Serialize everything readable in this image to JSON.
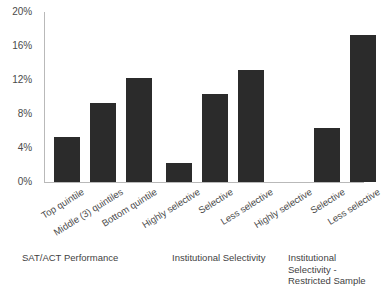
{
  "chart_data": {
    "type": "bar",
    "title": "",
    "subtitle": "",
    "xlabel": "",
    "ylabel": "",
    "ylim": [
      0,
      20
    ],
    "y_tick_labels": [
      "0%",
      "4%",
      "8%",
      "12%",
      "16%",
      "20%"
    ],
    "y_tick_values": [
      0,
      4,
      8,
      12,
      16,
      20
    ],
    "grid": false,
    "legend": "none",
    "bar_color": "#2b2b2b",
    "axis_color": "#b9b9b9",
    "value_suffix": "%",
    "categories": [
      "Top quintile",
      "Middle (3) quintiles",
      "Bottom quintile",
      "Highly selective",
      "Selective",
      "Less selective",
      "Highly selective",
      "Selective",
      "Less selective"
    ],
    "values": [
      5.3,
      9.3,
      12.2,
      2.2,
      10.4,
      13.2,
      0,
      6.3,
      17.3
    ],
    "groups": [
      {
        "caption": "SAT/ACT Performance",
        "categories": [
          "Top quintile",
          "Middle (3) quintiles",
          "Bottom quintile"
        ],
        "values": [
          5.3,
          9.3,
          12.2
        ]
      },
      {
        "caption": "Institutional Selectivity",
        "categories": [
          "Highly selective",
          "Selective",
          "Less selective"
        ],
        "values": [
          2.2,
          10.4,
          13.2
        ]
      },
      {
        "caption": "Institutional Selectivity - Restricted Sample",
        "categories": [
          "Highly selective",
          "Selective",
          "Less selective"
        ],
        "values": [
          0,
          6.3,
          17.3
        ]
      }
    ]
  }
}
